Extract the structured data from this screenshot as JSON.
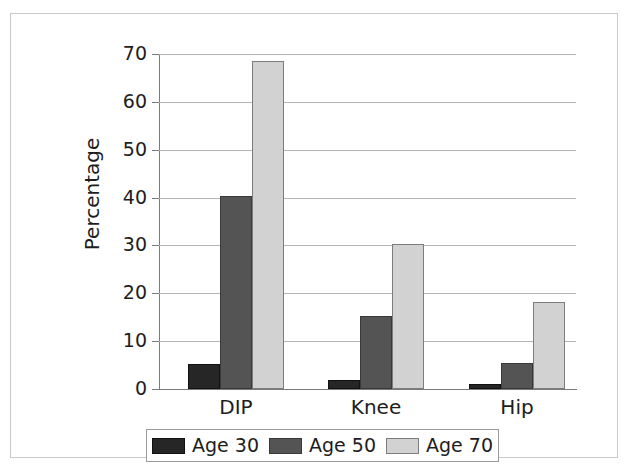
{
  "chart_data": {
    "type": "bar",
    "title": "",
    "xlabel": "",
    "ylabel": "Percentage",
    "categories": [
      "DIP",
      "Knee",
      "Hip"
    ],
    "series": [
      {
        "name": "Age 30",
        "color": "#262626",
        "values": [
          5.3,
          1.8,
          1.0
        ]
      },
      {
        "name": "Age 50",
        "color": "#545454",
        "values": [
          40.3,
          15.2,
          5.4
        ]
      },
      {
        "name": "Age 70",
        "color": "#d2d2d2",
        "values": [
          68.5,
          30.2,
          18.2
        ]
      }
    ],
    "ylim": [
      0,
      70
    ],
    "yticks": [
      0,
      10,
      20,
      30,
      40,
      50,
      60,
      70
    ],
    "ytick_labels": [
      "0",
      "10",
      "20",
      "30",
      "40",
      "50",
      "60",
      "70"
    ],
    "grid": true,
    "grid_axis": "y",
    "legend_position": "bottom",
    "bar_gap": false
  }
}
